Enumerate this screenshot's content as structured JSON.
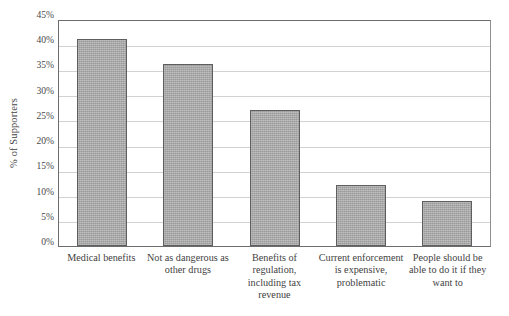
{
  "chart_data": {
    "type": "bar",
    "title": "",
    "xlabel": "",
    "ylabel": "% of Supporters",
    "ylim": [
      0,
      45
    ],
    "grid": true,
    "legend": false,
    "categories": [
      "Medical benefits",
      "Not as dangerous as other drugs",
      "Benefits of regulation, including tax revenue",
      "Current enforcement is expensive, problematic",
      "People should be able to do it if they want to"
    ],
    "values": [
      41,
      36,
      27,
      12,
      9
    ],
    "value_labels": [
      "41%",
      "36%",
      "27%",
      "12%",
      "9%"
    ],
    "y_ticks": [
      0,
      5,
      10,
      15,
      20,
      25,
      30,
      35,
      40,
      45
    ],
    "y_tick_labels": [
      "0%",
      "5%",
      "10%",
      "15%",
      "20%",
      "25%",
      "30%",
      "35%",
      "40%",
      "45%"
    ],
    "bar_fill_color": "#a9a9a9",
    "bar_border_color": "#5e5e5e",
    "gridline_color": "#d2d2d2",
    "axis_color": "#6d6d6d",
    "background_color": "#ffffff"
  },
  "axis": {
    "y_title": "% of Supporters"
  }
}
